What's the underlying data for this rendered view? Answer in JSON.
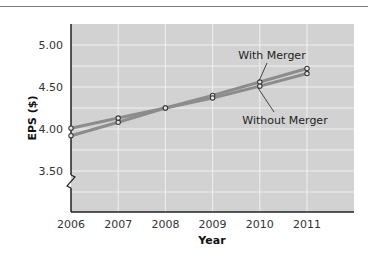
{
  "chart_data": {
    "type": "line",
    "title": "",
    "xlabel": "Year",
    "ylabel": "EPS ($)",
    "x": [
      2006,
      2007,
      2008,
      2009,
      2010,
      2011
    ],
    "x_tick_labels": [
      "2006",
      "2007",
      "2008",
      "2009",
      "2010",
      "2011"
    ],
    "y_tick_labels": [
      "5.00",
      "4.50",
      "4.00",
      "3.50"
    ],
    "y_ticks": [
      5.0,
      4.5,
      4.0,
      3.5
    ],
    "ylim": [
      3.02,
      5.25
    ],
    "xlim": [
      2006,
      2012
    ],
    "grid": true,
    "axis_break": true,
    "legend": "inline annotations",
    "series": [
      {
        "name": "With Merger",
        "values": [
          3.92,
          4.08,
          4.25,
          4.4,
          4.56,
          4.72
        ]
      },
      {
        "name": "Without Merger",
        "values": [
          4.01,
          4.13,
          4.25,
          4.37,
          4.51,
          4.66
        ]
      }
    ],
    "annotations": [
      {
        "text": "With Merger",
        "points_to": "2010"
      },
      {
        "text": "Without Merger",
        "points_to": "2010"
      }
    ]
  },
  "colors": {
    "plot_bg": "#d2d2d2",
    "grid": "#f0f0f0",
    "line": "#8c8c8c",
    "marker_stroke": "#3a3a3a",
    "axis": "#222222"
  }
}
